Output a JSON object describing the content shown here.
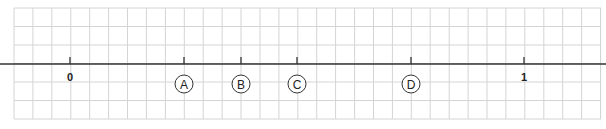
{
  "diagram": {
    "type": "number-line",
    "grid": {
      "x_start": 14,
      "x_end": 601,
      "y_start": 8,
      "y_end": 119,
      "cell": 18.92,
      "color": "#d4d4d4"
    },
    "axis": {
      "y": 64,
      "color": "#333333"
    },
    "ticks": [
      {
        "label": "0",
        "x": 70,
        "value": 0,
        "circled": false
      },
      {
        "label": "A",
        "x": 184,
        "value": 0.25,
        "circled": true
      },
      {
        "label": "B",
        "x": 241,
        "value": 0.375,
        "circled": true
      },
      {
        "label": "C",
        "x": 297,
        "value": 0.5,
        "circled": true
      },
      {
        "label": "D",
        "x": 411,
        "value": 0.75,
        "circled": true
      },
      {
        "label": "1",
        "x": 524,
        "value": 1,
        "circled": false
      }
    ]
  }
}
